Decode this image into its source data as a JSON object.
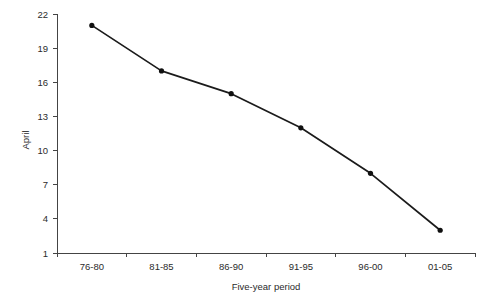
{
  "chart_data": {
    "type": "line",
    "title": "",
    "subtitle": "",
    "xlabel": "Five-year period",
    "ylabel": "April",
    "categories": [
      "76-80",
      "81-85",
      "86-90",
      "91-95",
      "96-00",
      "01-05"
    ],
    "values": [
      21,
      17,
      15,
      12,
      8,
      3
    ],
    "series": [
      {
        "name": "April",
        "values": [
          21,
          17,
          15,
          12,
          8,
          3
        ]
      }
    ],
    "ylim": [
      1,
      22
    ],
    "yticks": [
      1,
      4,
      7,
      10,
      13,
      16,
      19,
      22
    ],
    "ytick_labels": [
      "1",
      "4",
      "7",
      "10",
      "13",
      "16",
      "19",
      "22"
    ],
    "xtick_labels": [
      "76-80",
      "81-85",
      "86-90",
      "91-95",
      "96-00",
      "01-05"
    ],
    "grid": false,
    "legend": false,
    "legend_position": "none",
    "marker": "filled-circle",
    "line_color": "#1b1b1b",
    "marker_color": "#101010",
    "axis_color": "#444444",
    "text_color": "#2b2b2b",
    "background_color": "#ffffff"
  },
  "plot_geometry": {
    "left": 57,
    "right": 475,
    "top": 14,
    "bottom": 253,
    "ylabel_x": 29,
    "ylabel_y": 140,
    "xlabel_x": 266,
    "xlabel_y": 290
  }
}
